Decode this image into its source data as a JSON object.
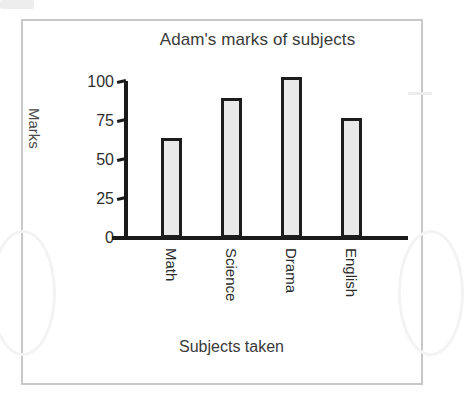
{
  "chart_data": {
    "type": "bar",
    "title": "Adam's marks of subjects",
    "xlabel": "Subjects taken",
    "ylabel": "Marks",
    "categories": [
      "Math",
      "Science",
      "Drama",
      "English"
    ],
    "values": [
      64,
      90,
      103,
      77
    ],
    "yticks": [
      "100",
      "75",
      "50",
      "25",
      "0"
    ],
    "ytick_values": [
      100,
      75,
      50,
      25,
      0
    ],
    "ylim": [
      0,
      100
    ],
    "grid": false,
    "legend": null,
    "bar_fill_color": "#e9e9e9",
    "bar_edge_color": "#1d1d1d",
    "axis_color": "#1a1a1a",
    "frame_color": "#c8c8c8",
    "background_color": "#ffffff"
  }
}
